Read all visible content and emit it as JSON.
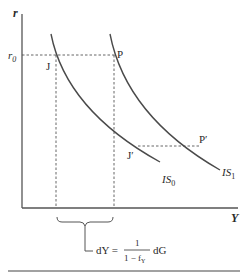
{
  "diagram": {
    "axes": {
      "y_label": "r",
      "x_label": "Y"
    },
    "levels": {
      "r0_label": "r",
      "r0_sub": "0"
    },
    "points": {
      "J": "J",
      "P": "P",
      "J_prime": "J′",
      "P_prime": "P′"
    },
    "curves": {
      "is0_label": "IS",
      "is0_sub": "0",
      "is1_label": "IS",
      "is1_sub": "1"
    },
    "formula": {
      "lhs": "dY =",
      "numerator": "1",
      "denominator_main": "1 − f",
      "denominator_sub": "Y",
      "rhs": "dG"
    },
    "colors": {
      "line": "#4a4a4a",
      "dash": "#555555",
      "text": "#2a2a2a"
    }
  }
}
